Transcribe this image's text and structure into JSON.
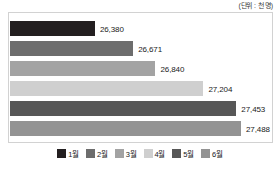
{
  "header": {
    "unit_note": "(단위 : 천 명)"
  },
  "chart_data": {
    "type": "bar",
    "orientation": "horizontal",
    "title": "",
    "subtitle": "",
    "xlabel": "",
    "ylabel": "",
    "unit": "천 명",
    "categories": [
      "1월",
      "2월",
      "3월",
      "4월",
      "5월",
      "6월"
    ],
    "values": [
      26380,
      26671,
      26840,
      27204,
      27453,
      27488
    ],
    "value_labels": [
      "26,380",
      "26,671",
      "26,840",
      "27,204",
      "27,453",
      "27,488"
    ],
    "colors": [
      "#231f20",
      "#6d6d6d",
      "#a3a3a3",
      "#cfcfcf",
      "#575757",
      "#939393"
    ],
    "xlim": [
      0,
      27900
    ],
    "grid": false,
    "legend_position": "bottom",
    "legend": [
      {
        "label": "1월",
        "color": "#231f20"
      },
      {
        "label": "2월",
        "color": "#6d6d6d"
      },
      {
        "label": "3월",
        "color": "#a3a3a3"
      },
      {
        "label": "4월",
        "color": "#cfcfcf"
      },
      {
        "label": "5월",
        "color": "#575757"
      },
      {
        "label": "6월",
        "color": "#939393"
      }
    ],
    "bars": [
      {
        "category": "1월",
        "value": 26380,
        "label": "26,380",
        "color": "#231f20",
        "bar_px": 255,
        "top_px": 8
      },
      {
        "category": "2월",
        "value": 26671,
        "label": "26,671",
        "color": "#6d6d6d",
        "bar_px": 370,
        "top_px": 28
      },
      {
        "category": "3월",
        "value": 26840,
        "label": "26,840",
        "color": "#a3a3a3",
        "bar_px": 437,
        "top_px": 48
      },
      {
        "category": "4월",
        "value": 27204,
        "label": "27,204",
        "color": "#cfcfcf",
        "bar_px": 581,
        "top_px": 68
      },
      {
        "category": "5월",
        "value": 27453,
        "label": "27,453",
        "color": "#575757",
        "bar_px": 680,
        "top_px": 88
      },
      {
        "category": "6월",
        "value": 27488,
        "label": "27,488",
        "color": "#939393",
        "bar_px": 694,
        "top_px": 108
      }
    ]
  }
}
